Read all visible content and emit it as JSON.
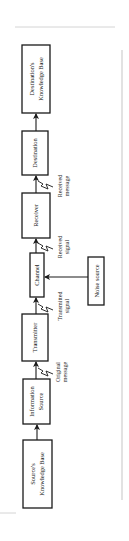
{
  "diagram": {
    "type": "communication-model",
    "orientation": "rotated-90-ccw",
    "boxes": {
      "source_kb": {
        "line1": "Source's",
        "line2": "Knowledge Base"
      },
      "info_source": {
        "line1": "Information",
        "line2": "Source"
      },
      "transmitter": {
        "label": "Transmitter"
      },
      "channel": {
        "label": "Channel"
      },
      "receiver": {
        "label": "Receiver"
      },
      "destination": {
        "label": "Destination"
      },
      "dest_kb": {
        "line1": "Destination's",
        "line2": "Knowledge Base"
      },
      "noise": {
        "label": "Noise source"
      }
    },
    "signals": {
      "original": {
        "line1": "Original",
        "line2": "message"
      },
      "transmitted": {
        "line1": "Transmitted",
        "line2": "signal"
      },
      "received_signal": {
        "line1": "Received",
        "line2": "signal"
      },
      "received_message": {
        "line1": "Received",
        "line2": "message"
      }
    },
    "flow": [
      "Source's Knowledge Base",
      "Information Source",
      "Transmitter",
      "Channel",
      "Receiver",
      "Destination",
      "Destination's Knowledge Base"
    ],
    "colors": {
      "ink": "#1a1a1a",
      "background": "#ffffff",
      "page_edge": "#d4d4d4"
    }
  }
}
